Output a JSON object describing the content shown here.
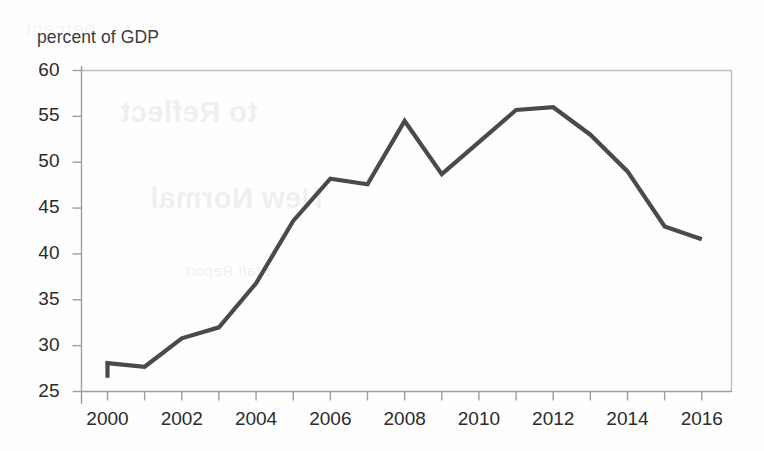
{
  "chart_data": {
    "type": "line",
    "title": "",
    "subtitle": "",
    "ylabel": "percent of GDP",
    "xlabel": "",
    "x": [
      2000,
      2001,
      2002,
      2003,
      2004,
      2005,
      2006,
      2007,
      2008,
      2009,
      2010,
      2011,
      2012,
      2013,
      2014,
      2015,
      2016
    ],
    "values": [
      28.1,
      27.7,
      30.8,
      32.0,
      36.8,
      43.6,
      48.2,
      47.6,
      54.5,
      48.7,
      52.2,
      55.7,
      56.0,
      53.0,
      49.0,
      43.0,
      41.6
    ],
    "series": [
      {
        "name": "percent of GDP",
        "values": [
          28.1,
          27.7,
          30.8,
          32.0,
          36.8,
          43.6,
          48.2,
          47.6,
          54.5,
          48.7,
          52.2,
          55.7,
          56.0,
          53.0,
          49.0,
          43.0,
          41.6
        ]
      }
    ],
    "start_marker": {
      "x": 2000,
      "y_from": 26.5,
      "y_to": 28.1,
      "note": "vertical stub at the left end of the line"
    },
    "xlim": [
      1999.3,
      2016.8
    ],
    "ylim": [
      25,
      60
    ],
    "ytick_values": [
      25,
      30,
      35,
      40,
      45,
      50,
      55,
      60
    ],
    "ytick_labels": [
      "25",
      "30",
      "35",
      "40",
      "45",
      "50",
      "55",
      "60"
    ],
    "xtick_values": [
      2000,
      2001,
      2002,
      2003,
      2004,
      2005,
      2006,
      2007,
      2008,
      2009,
      2010,
      2011,
      2012,
      2013,
      2014,
      2015,
      2016
    ],
    "xtick_labels_shown": [
      "2000",
      "2002",
      "2004",
      "2006",
      "2008",
      "2010",
      "2012",
      "2014",
      "2016"
    ],
    "xtick_labeled_values": [
      2000,
      2002,
      2004,
      2006,
      2008,
      2010,
      2012,
      2014,
      2016
    ],
    "grid": false,
    "legend": null,
    "legend_position": "none",
    "line_color": "#4a4a4a",
    "axis_color": "#b8b8b8",
    "background_color": "#fefefe",
    "text_color": "#2b2b2b"
  },
  "ghost_text": {
    "line1": "to Reflect",
    "line2": "New Normal",
    "line3": "Staff Report",
    "line4": "percent"
  }
}
